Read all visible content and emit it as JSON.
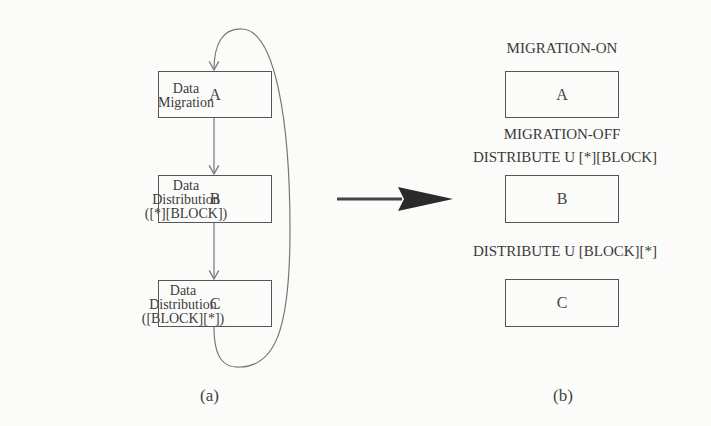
{
  "panel_a": {
    "caption": "(a)",
    "nodes": [
      {
        "id": "A",
        "label": "A",
        "side_label": [
          "Data",
          "Migration"
        ]
      },
      {
        "id": "B",
        "label": "B",
        "side_label": [
          "Data",
          "Distribution",
          "([*][BLOCK])"
        ]
      },
      {
        "id": "C",
        "label": "C",
        "side_label": [
          "Data",
          "Distribution",
          "([BLOCK][*])"
        ]
      }
    ],
    "edges": [
      {
        "from": "A",
        "to": "B"
      },
      {
        "from": "B",
        "to": "C"
      },
      {
        "from": "C",
        "to": "A",
        "type": "loop-back"
      }
    ]
  },
  "transform_arrow": {
    "direction": "right",
    "color": "#333333"
  },
  "panel_b": {
    "caption": "(b)",
    "annotations": {
      "before_A": "MIGRATION-ON",
      "before_B_line1": "MIGRATION-OFF",
      "before_B_line2": "DISTRIBUTE U [*][BLOCK]",
      "before_C": "DISTRIBUTE U [BLOCK][*]"
    },
    "nodes": [
      {
        "id": "A",
        "label": "A"
      },
      {
        "id": "B",
        "label": "B"
      },
      {
        "id": "C",
        "label": "C"
      }
    ]
  },
  "colors": {
    "line": "#777777",
    "box_border": "#555555",
    "text": "#3c3c3c",
    "background": "#fbfbf9"
  }
}
